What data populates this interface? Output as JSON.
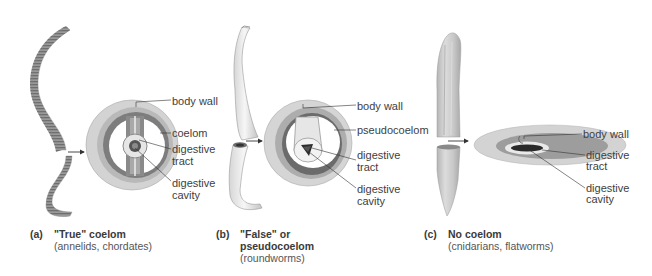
{
  "figure": {
    "panels": [
      {
        "id": "a",
        "tag": "(a)",
        "title": "\"True\" coelom",
        "subtitle": "(annelids, chordates)",
        "labels": {
          "body_wall": "body wall",
          "cavity_type": "coelom",
          "digestive_tract_1": "digestive",
          "digestive_tract_2": "tract",
          "digestive_cavity_1": "digestive",
          "digestive_cavity_2": "cavity"
        }
      },
      {
        "id": "b",
        "tag": "(b)",
        "title_line1": "\"False\" or",
        "title_line2": "pseudocoelom",
        "subtitle": "(roundworms)",
        "labels": {
          "body_wall": "body wall",
          "cavity_type": "pseudocoelom",
          "digestive_tract_1": "digestive",
          "digestive_tract_2": "tract",
          "digestive_cavity_1": "digestive",
          "digestive_cavity_2": "cavity"
        }
      },
      {
        "id": "c",
        "tag": "(c)",
        "title": "No coelom",
        "subtitle": "(cnidarians, flatworms)",
        "labels": {
          "body_wall": "body wall",
          "digestive_tract_1": "digestive",
          "digestive_tract_2": "tract",
          "digestive_cavity_1": "digestive",
          "digestive_cavity_2": "cavity"
        }
      }
    ]
  }
}
